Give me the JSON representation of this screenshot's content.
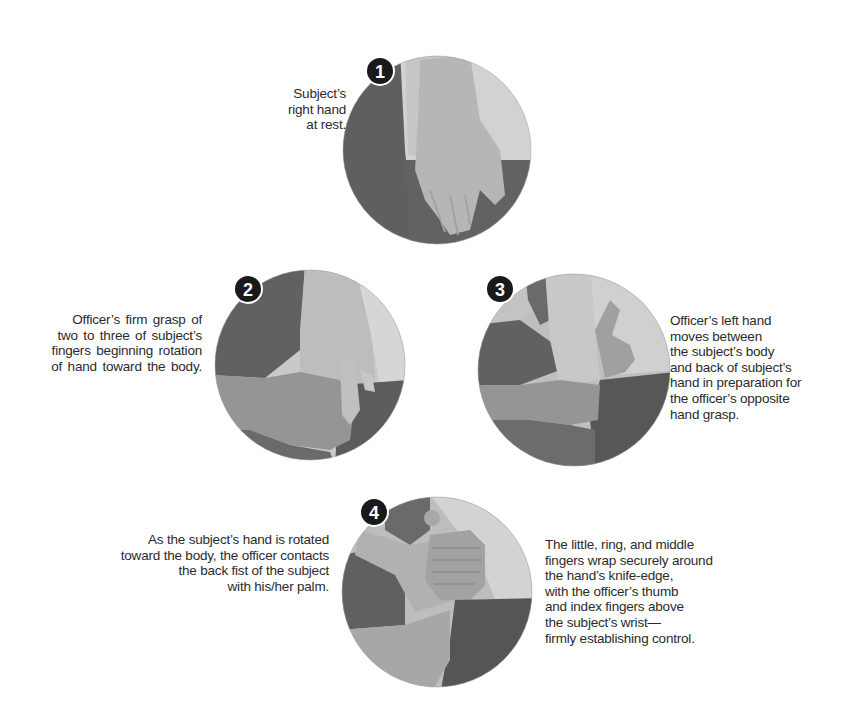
{
  "diagram": {
    "type": "step-sequence",
    "steps": [
      {
        "number": "1",
        "caption_lines": [
          "Subject’s",
          "right hand",
          "at rest."
        ]
      },
      {
        "number": "2",
        "caption_lines": [
          "Officer’s firm grasp of",
          "two to three of subject’s",
          "fingers beginning rotation",
          "of hand toward the body."
        ]
      },
      {
        "number": "3",
        "caption_lines": [
          "Officer’s left hand",
          "moves between",
          "the subject’s body",
          "and back of subject’s",
          "hand in preparation for",
          "the officer’s opposite",
          "hand grasp."
        ]
      },
      {
        "number": "4",
        "caption_left_lines": [
          "As the subject’s hand is rotated",
          "toward the body, the officer contacts",
          "the back fist of the subject",
          "with his/her palm."
        ],
        "caption_right_lines": [
          "The little, ring, and middle",
          "fingers wrap securely around",
          "the hand’s knife-edge,",
          "with the officer’s thumb",
          "and index fingers above",
          "the subject’s wrist—",
          "firmly establishing control."
        ]
      }
    ],
    "colors": {
      "dark_gray": "#5e5e5e",
      "mid_gray": "#8a8a8a",
      "skin_light": "#b9b9b9",
      "skin_lighter": "#cdcdcd",
      "background_light": "#d4d4d4",
      "badge": "#1a1a1a"
    }
  }
}
